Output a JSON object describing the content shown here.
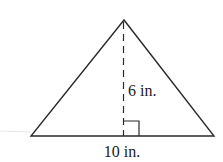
{
  "figure": {
    "shape": "triangle",
    "height_label": "6 in.",
    "base_label": "10 in.",
    "stroke_color": "#2a2a2a",
    "background": "#ffffff"
  }
}
